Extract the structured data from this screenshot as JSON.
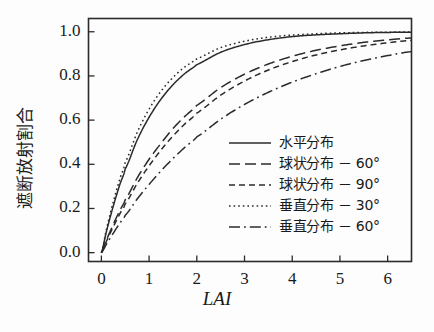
{
  "chart_data": {
    "type": "line",
    "title": "",
    "xlabel": "LAI",
    "ylabel": "遮断放射割合",
    "xlim": [
      -0.27,
      6.5
    ],
    "ylim": [
      -0.04,
      1.06
    ],
    "xticks": [
      0,
      1,
      2,
      3,
      4,
      5,
      6
    ],
    "xtick_labels": [
      "0",
      "1",
      "2",
      "3",
      "4",
      "5",
      "6"
    ],
    "yticks": [
      0.0,
      0.2,
      0.4,
      0.6,
      0.8,
      1.0
    ],
    "ytick_labels": [
      "0.0",
      "0.2",
      "0.4",
      "0.6",
      "0.8",
      "1.0"
    ],
    "grid": false,
    "legend_position": "center-right-inside",
    "frame": true,
    "line_color": "#2b2b2b",
    "background_color": "#fdfdfd",
    "x": [
      0,
      0.1,
      0.2,
      0.3,
      0.4,
      0.5,
      0.75,
      1,
      1.25,
      1.5,
      1.75,
      2,
      2.5,
      3,
      3.5,
      4,
      4.5,
      5,
      5.5,
      6,
      6.5
    ],
    "series": [
      {
        "name": "水平分布",
        "label": "水平分布",
        "style": "solid",
        "k": 0.95,
        "values": [
          0.0,
          0.091,
          0.173,
          0.248,
          0.317,
          0.379,
          0.51,
          0.613,
          0.695,
          0.76,
          0.811,
          0.851,
          0.907,
          0.942,
          0.964,
          0.978,
          0.986,
          0.991,
          0.995,
          0.997,
          0.998
        ]
      },
      {
        "name": "球状分布-60度",
        "label": "球状分布 － 60°",
        "label_main": "球状分布",
        "label_angle": "60",
        "style": "dashed",
        "k": 0.55,
        "values": [
          0.0,
          0.054,
          0.104,
          0.152,
          0.197,
          0.24,
          0.338,
          0.423,
          0.495,
          0.562,
          0.617,
          0.667,
          0.747,
          0.808,
          0.854,
          0.889,
          0.916,
          0.936,
          0.952,
          0.963,
          0.972
        ]
      },
      {
        "name": "球状分布-90度",
        "label": "球状分布 － 90°",
        "label_main": "球状分布",
        "label_angle": "90",
        "style": "shortdash",
        "k": 0.5,
        "values": [
          0.0,
          0.049,
          0.095,
          0.139,
          0.181,
          0.221,
          0.313,
          0.393,
          0.465,
          0.528,
          0.583,
          0.632,
          0.713,
          0.777,
          0.827,
          0.865,
          0.895,
          0.918,
          0.936,
          0.95,
          0.961
        ]
      },
      {
        "name": "垂直分布-30度",
        "label": "垂直分布 － 30°",
        "label_main": "垂直分布",
        "label_angle": "30",
        "style": "dotted",
        "k": 1.05,
        "values": [
          0.0,
          0.1,
          0.189,
          0.27,
          0.343,
          0.408,
          0.544,
          0.65,
          0.731,
          0.793,
          0.841,
          0.877,
          0.928,
          0.957,
          0.975,
          0.985,
          0.991,
          0.995,
          0.997,
          0.998,
          0.999
        ]
      },
      {
        "name": "垂直分布-60度",
        "label": "垂直分布 － 60°",
        "label_main": "垂直分布",
        "label_angle": "60",
        "style": "dashdot",
        "k": 0.37,
        "values": [
          0.0,
          0.036,
          0.071,
          0.105,
          0.138,
          0.169,
          0.243,
          0.309,
          0.37,
          0.426,
          0.477,
          0.524,
          0.604,
          0.671,
          0.726,
          0.772,
          0.81,
          0.843,
          0.87,
          0.892,
          0.91
        ]
      }
    ]
  },
  "legend": {
    "items": [
      {
        "label": "水平分布",
        "style": "solid"
      },
      {
        "label": "球状分布 － 60°",
        "style": "dashed"
      },
      {
        "label": "球状分布 － 90°",
        "style": "shortdash"
      },
      {
        "label": "垂直分布 － 30°",
        "style": "dotted"
      },
      {
        "label": "垂直分布 － 60°",
        "style": "dashdot"
      }
    ]
  },
  "axes": {
    "x_label": "LAI",
    "y_label": "遮断放射割合",
    "x_tick_labels": [
      "0",
      "1",
      "2",
      "3",
      "4",
      "5",
      "6"
    ],
    "y_tick_labels": [
      "0.0",
      "0.2",
      "0.4",
      "0.6",
      "0.8",
      "1.0"
    ]
  }
}
